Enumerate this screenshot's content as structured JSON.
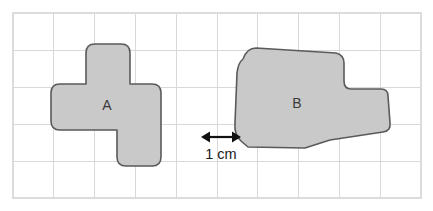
{
  "figure": {
    "kind": "geometry-diagram",
    "background_color": "#ffffff"
  },
  "grid": {
    "origin_x": 13,
    "origin_y": 13,
    "cell_width": 40.8,
    "cell_height": 37.0,
    "columns": 10,
    "rows": 5,
    "line_color": "#d9d9d9",
    "border_color": "#dcdcdc",
    "unit_label": "1 cm"
  },
  "shapes": [
    {
      "id": "shape-a",
      "label": "A",
      "label_x": 107,
      "label_y": 106,
      "fill_color": "#c9c9c9",
      "stroke_color": "#5a5a5a",
      "outline_path": "M 60 84 Q 51 84 51 93 L 51 121 Q 51 130 60 130 L 117 130 L 117 157 Q 117 166 126 166 L 152 166 Q 161 166 161 157 L 161 93 Q 161 84 152 84 L 130 84 L 130 53 Q 130 44 121 44 L 95 44 Q 86 44 86 53 L 86 84 Z",
      "grid_cells_estimate": 9
    },
    {
      "id": "shape-b",
      "label": "B",
      "label_x": 297,
      "label_y": 104,
      "fill_color": "#c9c9c9",
      "stroke_color": "#5a5a5a",
      "outline_path": "M 243 59 Q 238 63 237 73 L 235 123 Q 234 135 241 141 L 248 147 L 305 148 L 330 140 L 383 132 Q 391 131 390 123 L 388 96 Q 388 89 381 89 L 351 89 Q 344 89 344 81 L 344 63 Q 344 55 336 53 L 256 48 Q 247 48 243 59 Z",
      "grid_cells_estimate": 11
    }
  ],
  "scale_bar": {
    "name": "one-centimetre-scale",
    "label": "1 cm",
    "label_x": 221,
    "label_y": 155,
    "line_y": 137,
    "x_start": 201,
    "x_end": 241,
    "color": "#111111"
  }
}
